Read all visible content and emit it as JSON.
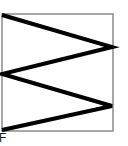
{
  "figure": {
    "caption": "F",
    "background_color": "#ffffff",
    "frame": {
      "x": 2,
      "y": 14,
      "width": 111,
      "height": 117,
      "stroke_color": "#8a8a8a",
      "stroke_width": 1.5,
      "fill_color": "#ffffff"
    },
    "zigzag": {
      "stroke_color": "#000000",
      "stroke_width": 4,
      "points": "2,15 112,47 2,74 112,106 2,130",
      "vertices": [
        {
          "x": 2,
          "y": 15
        },
        {
          "x": 112,
          "y": 47
        },
        {
          "x": 2,
          "y": 74
        },
        {
          "x": 112,
          "y": 106
        },
        {
          "x": 2,
          "y": 130
        }
      ]
    }
  }
}
